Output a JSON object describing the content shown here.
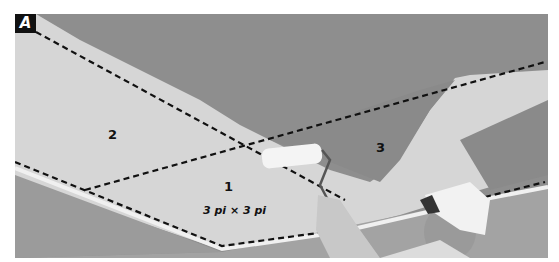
{
  "figure": {
    "badge": "A",
    "regions": [
      {
        "id": "1",
        "label": "1"
      },
      {
        "id": "2",
        "label": "2"
      },
      {
        "id": "3",
        "label": "3"
      }
    ],
    "dimension_label": "3 pi × 3 pi",
    "colors": {
      "unpainted_ceiling": "#8c8c8c",
      "painted_ceiling": "#d8d8d8",
      "wall": "#9a9a9a",
      "trim": "#efefef",
      "dashes": "#111111",
      "badge_bg": "#111111",
      "badge_text": "#ffffff"
    }
  }
}
